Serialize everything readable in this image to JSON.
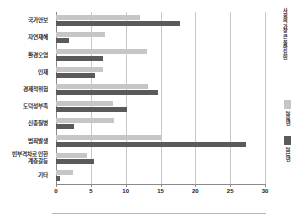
{
  "chart_data": {
    "type": "bar",
    "orientation": "horizontal",
    "title": "",
    "xlabel": "",
    "ylabel": "",
    "xlim": [
      0,
      30
    ],
    "grid": true,
    "legend_position": "right",
    "legend_title": "사회의 가장 큰 불안요인",
    "categories": [
      "국가안보",
      "자연재해",
      "환경오염",
      "인재",
      "경제적위험",
      "도덕성부족",
      "신종질병",
      "범죄발생",
      "빈부격차로 인한\n계층갈등",
      "기타"
    ],
    "xticks": [
      0,
      5,
      10,
      15,
      20,
      25,
      30
    ],
    "series": [
      {
        "name": "2008년",
        "color": "#c6c6c6",
        "values": [
          12.0,
          7.0,
          13.1,
          6.8,
          13.2,
          8.2,
          8.3,
          15.0,
          4.5,
          2.5
        ]
      },
      {
        "name": "2010년",
        "color": "#5a5a5a",
        "values": [
          17.8,
          1.8,
          6.7,
          5.6,
          14.6,
          10.2,
          2.6,
          27.3,
          5.5,
          0.6
        ]
      }
    ]
  }
}
